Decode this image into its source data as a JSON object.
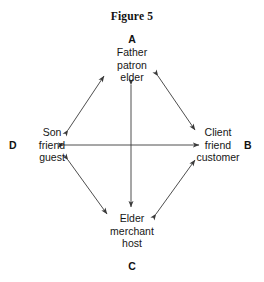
{
  "figure": {
    "title": "Figure 5"
  },
  "diagram": {
    "type": "node-network",
    "shape": "diamond",
    "nodes": [
      {
        "key": "A",
        "position": "top",
        "lines": [
          "Father",
          "patron",
          "elder"
        ]
      },
      {
        "key": "B",
        "position": "right",
        "lines": [
          "Client",
          "friend",
          "customer"
        ]
      },
      {
        "key": "C",
        "position": "bottom",
        "lines": [
          "Elder",
          "merchant",
          "host"
        ]
      },
      {
        "key": "D",
        "position": "left",
        "lines": [
          "Son",
          "friend",
          "guest"
        ]
      }
    ],
    "edges": [
      {
        "from": "D",
        "to": "A",
        "style": "double-headed-arrow"
      },
      {
        "from": "A",
        "to": "B",
        "style": "double-headed-arrow"
      },
      {
        "from": "D",
        "to": "C",
        "style": "double-headed-arrow"
      },
      {
        "from": "C",
        "to": "B",
        "style": "double-headed-arrow"
      },
      {
        "from": "D",
        "to": "B",
        "style": "double-headed-arrow"
      },
      {
        "from": "A",
        "to": "C",
        "style": "double-headed-arrow"
      }
    ],
    "line_color": "#3a3a3a",
    "background_color": "#ffffff"
  }
}
